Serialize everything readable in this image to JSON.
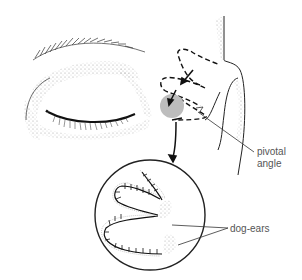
{
  "figure": {
    "labels": {
      "pivotal_angle_line1": "pivotal",
      "pivotal_angle_line2": "angle",
      "dog_ears": "dog-ears"
    },
    "colors": {
      "ink": "#222222",
      "stipple": "#9a9a9a",
      "highlight": "#b8b8b8",
      "label_text": "#555555"
    }
  }
}
